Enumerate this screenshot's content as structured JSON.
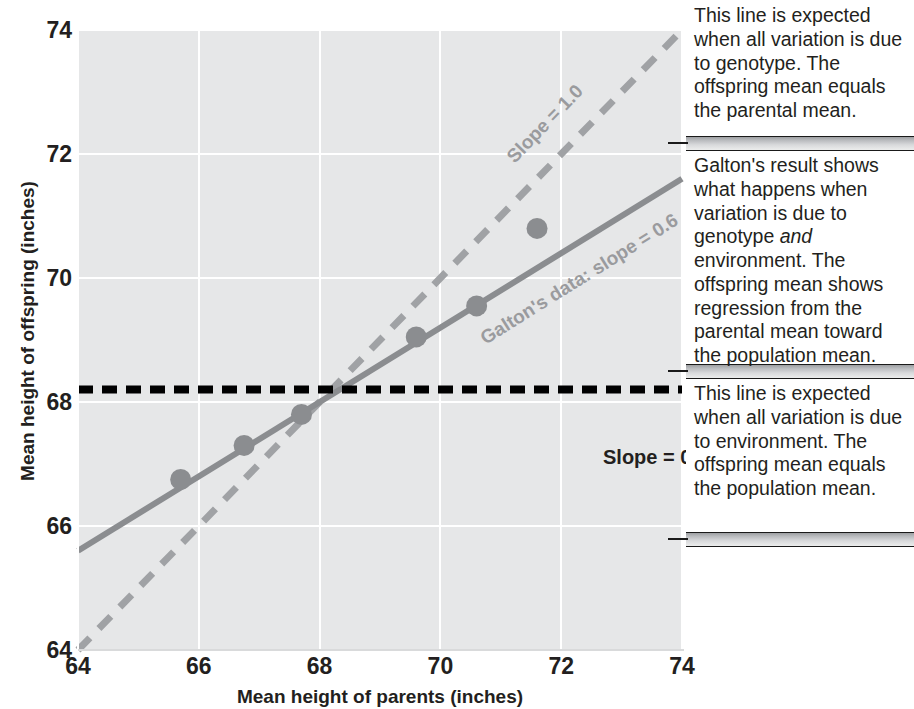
{
  "chart_data": {
    "type": "scatter",
    "title": "",
    "xlabel": "Mean height of parents (inches)",
    "ylabel": "Mean height of offspring (inches)",
    "xlim": [
      64,
      74
    ],
    "ylim": [
      64,
      74
    ],
    "xticks": [
      "64",
      "66",
      "68",
      "70",
      "72",
      "74"
    ],
    "yticks": [
      "64",
      "66",
      "68",
      "70",
      "72",
      "74"
    ],
    "grid": true,
    "legend": "none",
    "points": {
      "name": "Galton's data",
      "x": [
        65.7,
        66.75,
        67.7,
        69.6,
        70.6,
        71.6
      ],
      "y": [
        66.75,
        67.3,
        67.8,
        69.05,
        69.55,
        70.8
      ]
    },
    "series": [
      {
        "name": "Slope = 1.0",
        "style": "dashed",
        "color": "#a0a2a5",
        "slope": 1.0,
        "intercept": 0.0,
        "x": [
          64,
          74
        ],
        "y": [
          64,
          74
        ]
      },
      {
        "name": "Galton's data: slope = 0.6",
        "style": "solid",
        "color": "#8b8d90",
        "slope": 0.6,
        "intercept": 27.2,
        "x": [
          64,
          74
        ],
        "y": [
          65.6,
          71.6
        ]
      },
      {
        "name": "Slope = 0.0",
        "style": "dashed",
        "color": "#000000",
        "slope": 0.0,
        "intercept": 68.2,
        "x": [
          64,
          74
        ],
        "y": [
          68.2,
          68.2
        ]
      }
    ],
    "annotations": [
      "Slope = 1.0",
      "Galton's data: slope = 0.6",
      "Slope = 0.0"
    ]
  },
  "axes": {
    "x_title": "Mean height of parents (inches)",
    "y_title": "Mean height of offspring (inches)",
    "x_ticks": [
      "64",
      "66",
      "68",
      "70",
      "72",
      "74"
    ],
    "y_ticks": [
      "64",
      "66",
      "68",
      "70",
      "72",
      "74"
    ]
  },
  "plot_labels": {
    "slope_one": "Slope = 1.0",
    "galton": "Galton's data: slope = 0.6",
    "slope_zero": "Slope = 0.0"
  },
  "callouts": [
    {
      "id": "genotype-only",
      "text": "This line is expected when all variation is due to genotype. The offspring mean equals the parental mean."
    },
    {
      "id": "galton-result",
      "text_before": "Galton's result shows what happens when variation is due to genotype ",
      "emphasis": "and",
      "text_after": " environment. The offspring mean shows regression from the parental mean toward the population mean."
    },
    {
      "id": "environment-only",
      "text": "This line is expected when all variation is due to environment. The offspring mean equals the population mean."
    }
  ],
  "colors": {
    "plot_background": "#e6e7e8",
    "gridline": "#ffffff",
    "point_fill": "#8b8d90",
    "identity_line": "#a0a2a5",
    "regression_line": "#8b8d90",
    "population_line": "#000000",
    "text": "#231f20"
  }
}
